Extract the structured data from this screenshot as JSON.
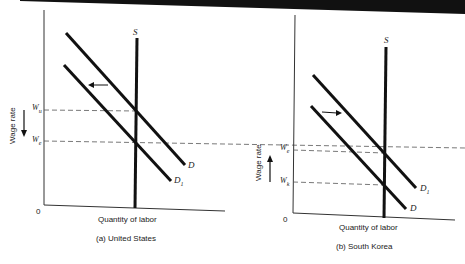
{
  "figure": {
    "panels": [
      {
        "id": "a",
        "caption": "(a)  United States",
        "x_axis_label": "Quantity of labor",
        "y_axis_label": "Wage rate",
        "origin_label": "0",
        "supply_label": "S",
        "demand_label": "D",
        "demand_new_label": "D",
        "demand_new_sub": "1",
        "wage_high": {
          "base": "W",
          "sub": "u"
        },
        "wage_low": {
          "base": "W",
          "sub": "e"
        },
        "shift_direction": "left",
        "wage_arrow_direction": "down"
      },
      {
        "id": "b",
        "caption": "(b)  South Korea",
        "x_axis_label": "Quantity of labor",
        "y_axis_label": "Wage rate",
        "origin_label": "0",
        "supply_label": "S",
        "demand_label": "D",
        "demand_new_label": "D",
        "demand_new_sub": "1",
        "wage_high": {
          "base": "W",
          "sub": "e"
        },
        "wage_low": {
          "base": "W",
          "sub": "k"
        },
        "shift_direction": "right",
        "wage_arrow_direction": "up"
      }
    ],
    "colors": {
      "line": "#111111",
      "dashed": "#555555",
      "text": "#222222",
      "background": "#ffffff"
    }
  }
}
